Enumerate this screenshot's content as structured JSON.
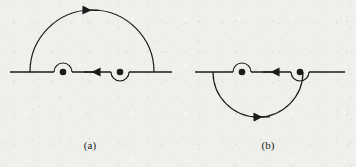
{
  "figure": {
    "background_color": "#efefec",
    "ink_color": "#1b1b1b",
    "panels": [
      {
        "id": "a",
        "caption": "(a)",
        "axis": {
          "label": "real-axis",
          "y": 72,
          "x_start": 10,
          "x_end": 172,
          "direction_arrow": "right",
          "arrow_x": 90
        },
        "major_arc": {
          "side": "upper",
          "center_x": 92,
          "radius": 62,
          "x_left": 30,
          "x_right": 154,
          "apex_y": 10,
          "direction": "counterclockwise",
          "arrow": "left",
          "arrow_x": 92
        },
        "poles": [
          {
            "name": "pole-1",
            "x": 63,
            "y": 72,
            "indentation": "above",
            "indent_radius": 9
          },
          {
            "name": "pole-2",
            "x": 120,
            "y": 72,
            "indentation": "below",
            "indent_radius": 9
          }
        ]
      },
      {
        "id": "b",
        "caption": "(b)",
        "axis": {
          "label": "real-axis",
          "y": 72,
          "x_start": 15,
          "x_end": 165,
          "direction_arrow": "right",
          "arrow_x": 90
        },
        "major_arc": {
          "side": "lower",
          "center_x": 78,
          "radius": 45,
          "x_left": 33,
          "x_right": 123,
          "apex_y": 135,
          "direction": "clockwise",
          "arrow": "left",
          "arrow_x": 78
        },
        "poles": [
          {
            "name": "pole-1",
            "x": 62,
            "y": 72,
            "indentation": "above",
            "indent_radius": 9
          },
          {
            "name": "pole-2",
            "x": 120,
            "y": 72,
            "indentation": "below",
            "indent_radius": 9
          }
        ]
      }
    ]
  }
}
